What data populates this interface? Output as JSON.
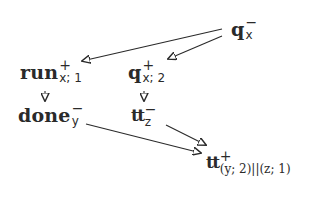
{
  "diagram": {
    "type": "directed-graph",
    "nodes": [
      {
        "id": "q_x",
        "base": "q",
        "sup": "−",
        "sub": "x",
        "label": "q_x^-"
      },
      {
        "id": "run_x1",
        "base": "run",
        "sup": "+",
        "sub": "x; 1",
        "label": "run_{x;1}^+"
      },
      {
        "id": "q_x2",
        "base": "q",
        "sup": "+",
        "sub": "x; 2",
        "label": "q_{x;2}^+"
      },
      {
        "id": "done_y",
        "base": "done",
        "sup": "−",
        "sub": "y",
        "label": "done_y^-"
      },
      {
        "id": "tt_z",
        "base": "tt",
        "sup": "−",
        "sub": "z",
        "label": "tt_z^-"
      },
      {
        "id": "tt_join",
        "base": "tt",
        "sup": "+",
        "sub": "(y; 2)||(z; 1)",
        "label": "tt^+_{(y;2)||(z;1)}"
      }
    ],
    "edges": [
      {
        "from": "q_x",
        "to": "run_x1"
      },
      {
        "from": "q_x",
        "to": "q_x2"
      },
      {
        "from": "run_x1",
        "to": "done_y"
      },
      {
        "from": "q_x2",
        "to": "tt_z"
      },
      {
        "from": "done_y",
        "to": "tt_join"
      },
      {
        "from": "tt_z",
        "to": "tt_join"
      }
    ],
    "colors": {
      "ink": "#2a2a2a",
      "background": "#ffffff"
    }
  }
}
